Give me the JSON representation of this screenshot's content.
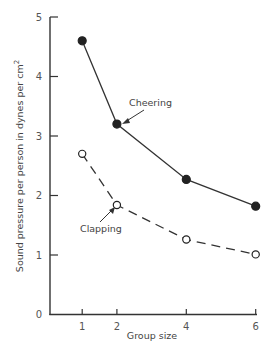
{
  "chart_data": {
    "type": "line",
    "title": "",
    "xlabel": "Group size",
    "ylabel": "Sound pressure per person in dynes per cm²",
    "ylabel_main": "Sound pressure per person in dynes per cm",
    "ylabel_sup": "2",
    "x": [
      1,
      2,
      4,
      6
    ],
    "xticks": [
      "1",
      "2",
      "4",
      "6"
    ],
    "yticks": [
      "0",
      "1",
      "2",
      "3",
      "4",
      "5"
    ],
    "xlim": [
      0,
      6
    ],
    "ylim": [
      0,
      5
    ],
    "grid": false,
    "legend": "inline annotations with arrows",
    "series": [
      {
        "name": "Cheering",
        "style": "solid, filled circles",
        "values": [
          4.6,
          3.2,
          2.27,
          1.82
        ]
      },
      {
        "name": "Clapping",
        "style": "dashed, open circles",
        "values": [
          2.7,
          1.84,
          1.26,
          1.01
        ]
      }
    ],
    "annotations": [
      {
        "text": "Cheering",
        "points_to": [
          2,
          3.2
        ]
      },
      {
        "text": "Clapping",
        "points_to": [
          2,
          1.84
        ]
      }
    ]
  }
}
